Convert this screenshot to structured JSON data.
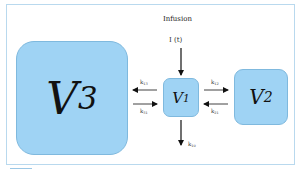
{
  "diagram": {
    "type": "three-compartment pharmacokinetic model",
    "input": {
      "title": "Infusion",
      "symbol": "I (t)"
    },
    "compartments": [
      {
        "id": "V3",
        "letter": "V",
        "subscript": "3"
      },
      {
        "id": "V1",
        "letter": "V",
        "subscript": "1"
      },
      {
        "id": "V2",
        "letter": "V",
        "subscript": "2"
      }
    ],
    "rate_constants": {
      "k13": {
        "k": "k",
        "sub": "13"
      },
      "k31": {
        "k": "k",
        "sub": "31"
      },
      "k12": {
        "k": "k",
        "sub": "12"
      },
      "k21": {
        "k": "k",
        "sub": "21"
      },
      "k10": {
        "k": "k",
        "sub": "10"
      }
    },
    "edges": [
      {
        "from": "Infusion",
        "to": "V1"
      },
      {
        "from": "V1",
        "to": "V3",
        "label": "k13"
      },
      {
        "from": "V3",
        "to": "V1",
        "label": "k31"
      },
      {
        "from": "V1",
        "to": "V2",
        "label": "k12"
      },
      {
        "from": "V2",
        "to": "V1",
        "label": "k21"
      },
      {
        "from": "V1",
        "to": "out",
        "label": "k10"
      }
    ],
    "colors": {
      "compartment_fill": "#9fd3f4",
      "compartment_border": "#7fb9de",
      "frame_border": "#b9d9ee",
      "arrow": "#111111"
    }
  }
}
